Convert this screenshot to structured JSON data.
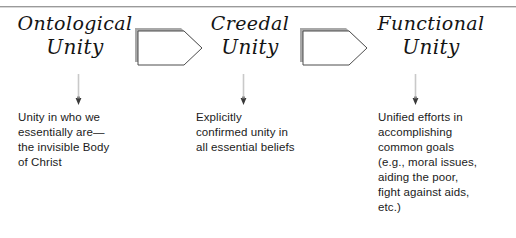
{
  "diagram": {
    "type": "three-stage-flow",
    "divider": "horizontal-rule-top",
    "colors": {
      "text": "#1b1b1b",
      "heading_text": "#141414",
      "shape_outline": "#4d4d4d",
      "shape_shadow": "#a8a8a8",
      "shape_fill": "#ffffff",
      "connector_line": "#c9c9c9",
      "connector_head": "#3a3a3a",
      "rule": "#9a9a9a"
    },
    "stages": [
      {
        "id": "ontological",
        "heading_line1": "Ontological",
        "heading_line2": "Unity",
        "connector_icon": "down-arrow-icon",
        "body_lines": [
          "Unity in who we",
          "essentially are—",
          "the invisible Body",
          "of Christ"
        ]
      },
      {
        "id": "creedal",
        "heading_line1": "Creedal",
        "heading_line2": "Unity",
        "connector_icon": "down-arrow-icon",
        "body_lines": [
          "Explicitly",
          "confirmed unity in",
          "all essential beliefs"
        ]
      },
      {
        "id": "functional",
        "heading_line1": "Functional",
        "heading_line2": "Unity",
        "connector_icon": "down-arrow-icon",
        "body_lines": [
          "Unified efforts in",
          "accomplishing",
          "common goals",
          "(e.g., moral issues,",
          "aiding the poor,",
          "fight against aids,",
          "etc.)"
        ]
      }
    ],
    "transitions": [
      {
        "id": "transition-1",
        "icon": "block-arrow-right-icon",
        "label": ""
      },
      {
        "id": "transition-2",
        "icon": "block-arrow-right-icon",
        "label": ""
      }
    ]
  }
}
